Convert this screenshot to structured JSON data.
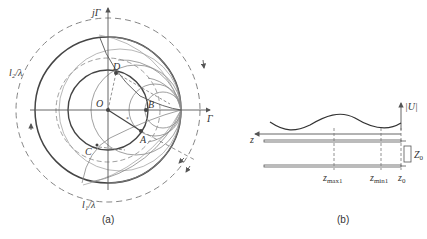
{
  "figure_a": {
    "caption": "(a)",
    "axis_labels": {
      "imag": "jΓ",
      "real": "Γ"
    },
    "points": {
      "O": "O",
      "A": "A",
      "B": "B",
      "C": "C",
      "D": "D"
    },
    "arc_labels": {
      "l1": "l₁/λ",
      "l2": "l₂/λ"
    }
  },
  "figure_b": {
    "caption": "(b)",
    "axis_labels": {
      "U": "|U|",
      "z": "z"
    },
    "positions": {
      "zmax1": "z",
      "zmax1_sub": "max1",
      "zmin1": "z",
      "zmin1_sub": "min1",
      "z0": "z",
      "z0_sub": "0"
    },
    "load": {
      "label": "Z",
      "sub": "0"
    }
  },
  "colors": {
    "line": "#555555",
    "dark": "#3a3a3a",
    "light": "#8a8a8a",
    "dash": "#777777"
  }
}
